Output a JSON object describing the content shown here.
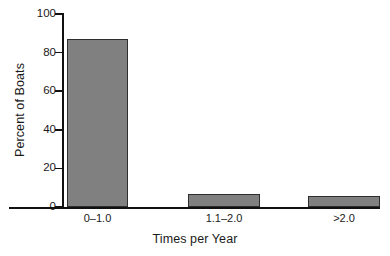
{
  "chart_data": {
    "type": "bar",
    "title": "",
    "subtitle": "",
    "categories": [
      "0–1.0",
      "1.1–2.0",
      ">2.0"
    ],
    "values": [
      87,
      7,
      5.5
    ],
    "xlabel": "Times per Year",
    "ylabel": "Percent of Boats",
    "ylim": [
      0,
      100
    ],
    "yticks": [
      0,
      20,
      40,
      60,
      80,
      100
    ],
    "ytick_labels": [
      "0",
      "20",
      "40",
      "60",
      "80",
      "100"
    ],
    "grid": false,
    "legend": false,
    "legend_position": "none",
    "annotations": [],
    "colors": {
      "bar_fill": "#808080",
      "bar_border": "#2e2e2e",
      "axis": "#111111",
      "text": "#1a1a1a",
      "background": "#ffffff"
    }
  },
  "axes": {
    "y_title": "Percent of Boats",
    "x_title": "Times per Year",
    "y_ticks": [
      {
        "label": "100",
        "value": 100
      },
      {
        "label": "80",
        "value": 80
      },
      {
        "label": "60",
        "value": 60
      },
      {
        "label": "40",
        "value": 40
      },
      {
        "label": "20",
        "value": 20
      },
      {
        "label": "0",
        "value": 0
      }
    ]
  },
  "bars": [
    {
      "label": "0–1.0",
      "value": 87
    },
    {
      "label": "1.1–2.0",
      "value": 7
    },
    {
      "label": ">2.0",
      "value": 5.5
    }
  ]
}
